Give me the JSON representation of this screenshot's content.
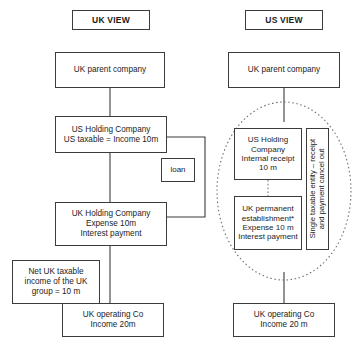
{
  "diagram": {
    "line_color": "#3b3b3b",
    "background": "#ffffff"
  },
  "headers": {
    "uk_view": "UK VIEW",
    "us_view": "US VIEW"
  },
  "uk_column": {
    "parent": "UK parent company",
    "us_holding": "US Holding Company\nUS taxable = Income 10m",
    "loan": "loan",
    "uk_holding": "UK Holding Company\nExpense 10m\nInterest payment",
    "net_taxable": "Net UK taxable\nincome of the UK\ngroup = 10 m",
    "operating": "UK operating Co\nIncome 20m"
  },
  "us_column": {
    "parent": "UK parent company",
    "us_holding": "US Holding\nCompany\nInternal receipt\n10 m",
    "permanent_establishment": "UK permanent\nestablishment*\nExpense 10 m\nInterest payment",
    "annotation": "Single taxable entity – receipt\nand payment cancel out",
    "operating": "UK operating Co\nIncome 20 m"
  },
  "footer": {
    "caption": ""
  }
}
